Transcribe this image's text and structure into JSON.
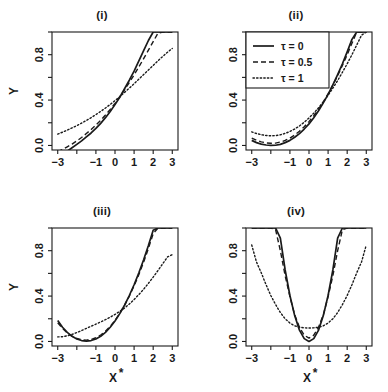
{
  "figure": {
    "background": "#ffffff",
    "ink": "#1a1a1a",
    "panel_rows": 2,
    "panel_cols": 2
  },
  "legend": {
    "position": "top-left of panel (ii)",
    "border": true,
    "entries": [
      {
        "label": "τ = 0",
        "style": "solid",
        "dash": "none"
      },
      {
        "label": "τ = 0.5",
        "style": "dashed",
        "dash": "5,3"
      },
      {
        "label": "τ = 1",
        "style": "dotted",
        "dash": "1.4,2.2"
      }
    ]
  },
  "axes": {
    "x_ticks_values": [
      -3,
      -2,
      -1,
      0,
      1,
      2,
      3
    ],
    "x_ticks_labels": [
      "-3",
      "",
      "-1",
      "0",
      "1",
      "2",
      "3"
    ],
    "y_ticks_values": [
      0.0,
      0.2,
      0.4,
      0.6,
      0.8,
      1.0
    ],
    "y_ticks_labels": [
      "0.0",
      "",
      "0.4",
      "",
      "0.8",
      ""
    ],
    "xlim": [
      -3.3,
      3.3
    ],
    "ylim": [
      -0.04,
      1.0
    ],
    "xlabel": "X",
    "xlabel_sup": "*",
    "ylabel": "Y"
  },
  "chart_data": {
    "type": "line",
    "title": "",
    "xlabel": "X*",
    "ylabel": "Y",
    "xlim": [
      -3.3,
      3.3
    ],
    "ylim": [
      -0.04,
      1.0
    ],
    "grid": false,
    "legend_position": "top-left of panel (ii)",
    "x_tick_labels": [
      "-3",
      "",
      "-1",
      "0",
      "1",
      "2",
      "3"
    ],
    "y_tick_labels": [
      "0.0",
      "",
      "0.4",
      "",
      "0.8",
      ""
    ],
    "panels": [
      {
        "id": "i",
        "title": "(i)",
        "description": "monotone increasing curves crossing near x=0, y=0.37",
        "x": [
          -3.0,
          -2.75,
          -2.5,
          -2.25,
          -2.0,
          -1.75,
          -1.5,
          -1.25,
          -1.0,
          -0.75,
          -0.5,
          -0.25,
          0.0,
          0.25,
          0.5,
          0.75,
          1.0,
          1.25,
          1.5,
          1.75,
          2.0,
          2.25,
          2.5,
          2.75,
          3.0
        ],
        "series": [
          {
            "name": "τ = 0",
            "style": "solid",
            "values": [
              -0.1,
              -0.075,
              -0.05,
              -0.02,
              0.01,
              0.04,
              0.075,
              0.11,
              0.15,
              0.195,
              0.245,
              0.3,
              0.36,
              0.425,
              0.5,
              0.575,
              0.655,
              0.745,
              0.835,
              0.925,
              1.0,
              1.0,
              1.0,
              1.0,
              1.0
            ]
          },
          {
            "name": "τ = 0.5",
            "style": "dashed",
            "values": [
              -0.055,
              -0.035,
              -0.012,
              0.012,
              0.04,
              0.07,
              0.105,
              0.14,
              0.18,
              0.222,
              0.268,
              0.318,
              0.37,
              0.428,
              0.49,
              0.555,
              0.622,
              0.693,
              0.765,
              0.84,
              0.915,
              0.99,
              1.0,
              1.0,
              1.0
            ]
          },
          {
            "name": "τ = 1",
            "style": "dotted",
            "values": [
              0.1,
              0.117,
              0.135,
              0.155,
              0.175,
              0.197,
              0.22,
              0.245,
              0.272,
              0.3,
              0.33,
              0.362,
              0.395,
              0.43,
              0.468,
              0.505,
              0.545,
              0.585,
              0.625,
              0.665,
              0.705,
              0.745,
              0.785,
              0.822,
              0.855
            ]
          }
        ]
      },
      {
        "id": "ii",
        "title": "(ii)",
        "description": "convex curves with shallow minimum near x=-2, rising steeply to the right",
        "x": [
          -3.0,
          -2.75,
          -2.5,
          -2.25,
          -2.0,
          -1.75,
          -1.5,
          -1.25,
          -1.0,
          -0.75,
          -0.5,
          -0.25,
          0.0,
          0.25,
          0.5,
          0.75,
          1.0,
          1.25,
          1.5,
          1.75,
          2.0,
          2.25,
          2.5,
          2.75,
          3.0
        ],
        "series": [
          {
            "name": "τ = 0",
            "style": "solid",
            "values": [
              0.045,
              0.025,
              0.012,
              0.004,
              0.0,
              0.002,
              0.01,
              0.025,
              0.045,
              0.072,
              0.105,
              0.145,
              0.19,
              0.245,
              0.305,
              0.375,
              0.45,
              0.535,
              0.625,
              0.72,
              0.825,
              0.935,
              1.0,
              1.0,
              1.0
            ]
          },
          {
            "name": "τ = 0.5",
            "style": "dashed",
            "values": [
              0.065,
              0.046,
              0.032,
              0.023,
              0.019,
              0.021,
              0.03,
              0.044,
              0.065,
              0.092,
              0.125,
              0.165,
              0.21,
              0.262,
              0.32,
              0.385,
              0.455,
              0.532,
              0.615,
              0.705,
              0.8,
              0.9,
              1.0,
              1.0,
              1.0
            ]
          },
          {
            "name": "τ = 1",
            "style": "dotted",
            "values": [
              0.12,
              0.105,
              0.095,
              0.088,
              0.085,
              0.087,
              0.094,
              0.106,
              0.123,
              0.145,
              0.172,
              0.205,
              0.242,
              0.285,
              0.332,
              0.385,
              0.442,
              0.505,
              0.572,
              0.645,
              0.72,
              0.8,
              0.885,
              0.972,
              1.0
            ]
          }
        ]
      },
      {
        "id": "iii",
        "title": "(iii)",
        "description": "U-shaped curves with minimum near x=-1.6, increasing steeply to the right",
        "x": [
          -3.0,
          -2.75,
          -2.5,
          -2.25,
          -2.0,
          -1.75,
          -1.5,
          -1.25,
          -1.0,
          -0.75,
          -0.5,
          -0.25,
          0.0,
          0.25,
          0.5,
          0.75,
          1.0,
          1.25,
          1.5,
          1.75,
          2.0,
          2.25,
          2.5,
          2.75,
          3.0
        ],
        "series": [
          {
            "name": "τ = 0",
            "style": "solid",
            "values": [
              0.185,
              0.125,
              0.08,
              0.045,
              0.022,
              0.008,
              0.003,
              0.008,
              0.022,
              0.045,
              0.08,
              0.125,
              0.18,
              0.245,
              0.32,
              0.405,
              0.5,
              0.605,
              0.72,
              0.845,
              0.98,
              1.0,
              1.0,
              1.0,
              1.0
            ]
          },
          {
            "name": "τ = 0.5",
            "style": "dashed",
            "values": [
              0.165,
              0.115,
              0.075,
              0.046,
              0.026,
              0.015,
              0.012,
              0.018,
              0.033,
              0.057,
              0.09,
              0.133,
              0.185,
              0.247,
              0.318,
              0.4,
              0.49,
              0.59,
              0.7,
              0.82,
              0.95,
              1.0,
              1.0,
              1.0,
              1.0
            ]
          },
          {
            "name": "τ = 1",
            "style": "dotted",
            "values": [
              0.04,
              0.042,
              0.05,
              0.062,
              0.078,
              0.096,
              0.115,
              0.134,
              0.153,
              0.172,
              0.192,
              0.214,
              0.238,
              0.265,
              0.295,
              0.33,
              0.37,
              0.413,
              0.46,
              0.512,
              0.567,
              0.625,
              0.685,
              0.745,
              0.765
            ]
          }
        ]
      },
      {
        "id": "iv",
        "title": "(iv)",
        "description": "symmetric parabolas centred at x=0; solid narrowest, dotted widest and flattest",
        "x": [
          -3.0,
          -2.75,
          -2.5,
          -2.25,
          -2.0,
          -1.75,
          -1.5,
          -1.25,
          -1.0,
          -0.75,
          -0.5,
          -0.25,
          0.0,
          0.25,
          0.5,
          0.75,
          1.0,
          1.25,
          1.5,
          1.75,
          2.0,
          2.25,
          2.5,
          2.75,
          3.0
        ],
        "series": [
          {
            "name": "τ = 0",
            "style": "solid",
            "values": [
              1.0,
              1.0,
              1.0,
              1.0,
              1.0,
              1.0,
              0.91,
              0.63,
              0.405,
              0.228,
              0.1,
              0.025,
              0.0,
              0.025,
              0.1,
              0.228,
              0.405,
              0.63,
              0.91,
              1.0,
              1.0,
              1.0,
              1.0,
              1.0,
              1.0
            ]
          },
          {
            "name": "τ = 0.5",
            "style": "dashed",
            "values": [
              1.0,
              1.0,
              1.0,
              1.0,
              1.0,
              0.985,
              0.8,
              0.58,
              0.395,
              0.235,
              0.125,
              0.055,
              0.03,
              0.055,
              0.125,
              0.235,
              0.395,
              0.58,
              0.8,
              0.985,
              1.0,
              1.0,
              1.0,
              1.0,
              1.0
            ]
          },
          {
            "name": "τ = 1",
            "style": "dotted",
            "values": [
              0.85,
              0.7,
              0.605,
              0.5,
              0.405,
              0.325,
              0.255,
              0.2,
              0.162,
              0.138,
              0.125,
              0.12,
              0.118,
              0.12,
              0.125,
              0.138,
              0.162,
              0.2,
              0.255,
              0.325,
              0.405,
              0.5,
              0.605,
              0.7,
              0.85
            ]
          }
        ]
      }
    ]
  }
}
